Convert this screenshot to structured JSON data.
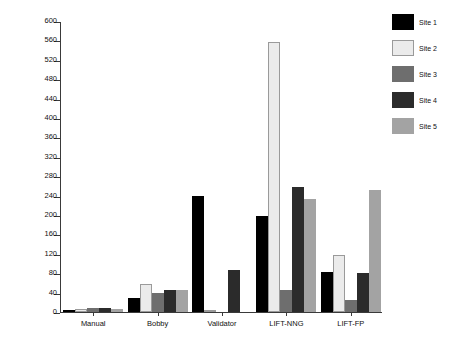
{
  "chart_data": {
    "type": "bar",
    "title": "",
    "xlabel": "",
    "ylabel": "Total number of problems",
    "ylim": [
      0,
      600
    ],
    "ytick_step": 40,
    "yticks": [
      0,
      40,
      80,
      120,
      160,
      200,
      240,
      280,
      320,
      360,
      400,
      440,
      480,
      520,
      560,
      600
    ],
    "grid": false,
    "legend_position": "top-right",
    "categories": [
      "Manual",
      "Bobby",
      "Validator",
      "LIFT-NNG",
      "LIFT-FP"
    ],
    "series": [
      {
        "name": "Site 1",
        "color": "#000000",
        "values": [
          5,
          29,
          239,
          199,
          83
        ]
      },
      {
        "name": "Site 2",
        "color": "#ebebeb",
        "values": [
          6,
          58,
          0,
          556,
          118
        ]
      },
      {
        "name": "Site 3",
        "color": "#6e6e6e",
        "values": [
          8,
          40,
          0,
          45,
          24
        ]
      },
      {
        "name": "Site 4",
        "color": "#2b2b2b",
        "values": [
          9,
          46,
          86,
          258,
          81
        ]
      },
      {
        "name": "Site 5",
        "color": "#a3a3a3",
        "values": [
          7,
          45,
          0,
          233,
          252
        ]
      }
    ]
  },
  "legend": {
    "items": [
      {
        "label": "Site 1"
      },
      {
        "label": "Site 2"
      },
      {
        "label": "Site 3"
      },
      {
        "label": "Site 4"
      },
      {
        "label": "Site 5"
      }
    ]
  }
}
